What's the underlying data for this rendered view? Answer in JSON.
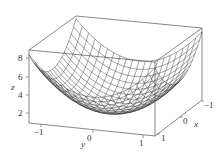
{
  "chart_data": {
    "type": "surface3d",
    "title": "",
    "function": "z = 4(x^2 + y^2) (paraboloid wireframe)",
    "xlabel": "x",
    "ylabel": "y",
    "zlabel": "z",
    "x_ticks": [
      "1",
      "0",
      "-1"
    ],
    "y_ticks": [
      "-1",
      "0",
      "1"
    ],
    "z_ticks": [
      "2",
      "4",
      "6",
      "8"
    ],
    "xlim": [
      -1,
      1
    ],
    "ylim": [
      -1.05,
      1.05
    ],
    "zlim": [
      0,
      9
    ],
    "grid_lines_per_axis": 21,
    "box": true,
    "colors": {
      "line": "#333333",
      "surface": "#ffffff",
      "axis": "#555555"
    }
  },
  "labels": {
    "x_axis": "x",
    "y_axis": "y",
    "z_axis": "z",
    "z_tick_8": "8",
    "z_tick_6": "6",
    "z_tick_4": "4",
    "z_tick_2": "2",
    "y_tick_m1": "−1",
    "y_tick_0": "0",
    "y_tick_1": "1",
    "x_tick_1": "1",
    "x_tick_0": "0",
    "x_tick_m1": "−1"
  }
}
